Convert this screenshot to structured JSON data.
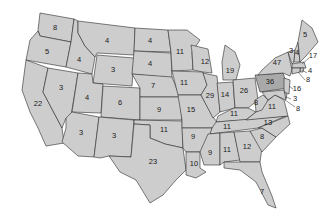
{
  "map": {
    "subject": "United States electoral votes by state",
    "colors": {
      "state_fill": "#cdcdcd",
      "highlight_fill": "#a9a9a9",
      "border": "#2a2a2a",
      "background": "#ffffff"
    },
    "highlighted_state": "PA",
    "states": [
      {
        "id": "WA",
        "value": "8"
      },
      {
        "id": "OR",
        "value": "5"
      },
      {
        "id": "CA",
        "value": "22"
      },
      {
        "id": "ID",
        "value": "4"
      },
      {
        "id": "NV",
        "value": "3"
      },
      {
        "id": "MT",
        "value": "4"
      },
      {
        "id": "WY",
        "value": "3"
      },
      {
        "id": "UT",
        "value": "4"
      },
      {
        "id": "CO",
        "value": "6"
      },
      {
        "id": "AZ",
        "value": "3"
      },
      {
        "id": "NM",
        "value": "3"
      },
      {
        "id": "ND",
        "value": "4"
      },
      {
        "id": "SD",
        "value": "4"
      },
      {
        "id": "NE",
        "value": "7"
      },
      {
        "id": "KS",
        "value": "9"
      },
      {
        "id": "OK",
        "value": "11"
      },
      {
        "id": "TX",
        "value": "23"
      },
      {
        "id": "MN",
        "value": "11"
      },
      {
        "id": "IA",
        "value": "11"
      },
      {
        "id": "MO",
        "value": "15"
      },
      {
        "id": "AR",
        "value": "9"
      },
      {
        "id": "LA",
        "value": "10"
      },
      {
        "id": "WI",
        "value": "12"
      },
      {
        "id": "IL",
        "value": "29"
      },
      {
        "id": "MI",
        "value": "19"
      },
      {
        "id": "IN",
        "value": "14"
      },
      {
        "id": "OH",
        "value": "26"
      },
      {
        "id": "KY",
        "value": "11"
      },
      {
        "id": "TN",
        "value": "11"
      },
      {
        "id": "MS",
        "value": "9"
      },
      {
        "id": "AL",
        "value": "11"
      },
      {
        "id": "GA",
        "value": "12"
      },
      {
        "id": "FL",
        "value": "7"
      },
      {
        "id": "SC",
        "value": "8"
      },
      {
        "id": "NC",
        "value": "13"
      },
      {
        "id": "VA",
        "value": "11"
      },
      {
        "id": "WV",
        "value": "8"
      },
      {
        "id": "PA",
        "value": "36"
      },
      {
        "id": "NY",
        "value": "47"
      },
      {
        "id": "VT",
        "value": "3"
      },
      {
        "id": "NH",
        "value": "4"
      },
      {
        "id": "ME",
        "value": "5"
      },
      {
        "id": "MA",
        "value": "17"
      },
      {
        "id": "RI",
        "value": "4"
      },
      {
        "id": "CT",
        "value": "8"
      },
      {
        "id": "NJ",
        "value": "16"
      },
      {
        "id": "DE",
        "value": "3"
      },
      {
        "id": "MD",
        "value": "8"
      }
    ]
  }
}
